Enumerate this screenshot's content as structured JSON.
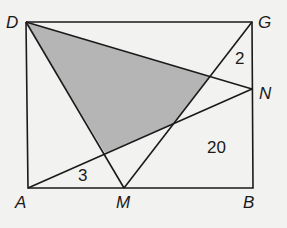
{
  "diagram": {
    "points": {
      "D": {
        "label": "D",
        "x": 26,
        "y": 22
      },
      "G": {
        "label": "G",
        "x": 252,
        "y": 22
      },
      "N": {
        "label": "N",
        "x": 252,
        "y": 89
      },
      "A": {
        "label": "A",
        "x": 28,
        "y": 188
      },
      "M": {
        "label": "M",
        "x": 124,
        "y": 188
      },
      "B": {
        "label": "B",
        "x": 253,
        "y": 188
      }
    },
    "region_labels": {
      "r1": "2",
      "r2": "20",
      "r3": "3"
    },
    "colors": {
      "line": "#1a1a1a",
      "shade": "#b5b5b5",
      "background": "#f2f2f0"
    }
  }
}
